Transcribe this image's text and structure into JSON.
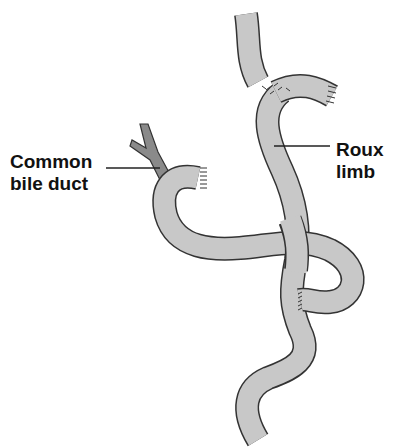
{
  "diagram": {
    "type": "anatomical illustration",
    "labels": [
      {
        "id": "common-bile-duct",
        "lines": [
          "Common",
          "bile duct"
        ]
      },
      {
        "id": "roux-limb",
        "lines": [
          "Roux",
          "limb"
        ]
      }
    ],
    "colors": {
      "bowel_fill": "#c8c8c8",
      "outline": "#333333",
      "duct_fill": "#8a8a8a",
      "text": "#111111"
    }
  }
}
